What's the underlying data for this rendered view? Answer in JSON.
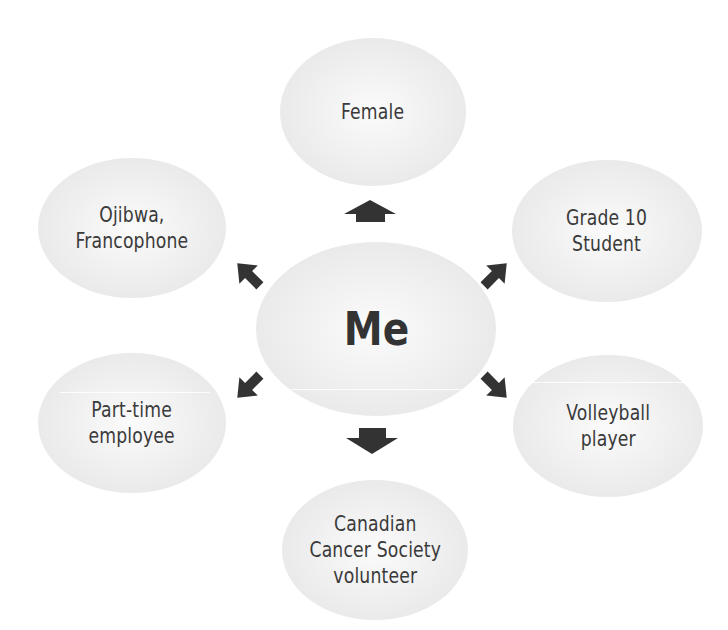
{
  "diagram": {
    "type": "identity-mind-map",
    "center": {
      "label": "Me"
    },
    "nodes": [
      {
        "id": "top",
        "label": "Female"
      },
      {
        "id": "upper-left",
        "label": "Ojibwa,\nFrancophone"
      },
      {
        "id": "upper-right",
        "label": "Grade 10\nStudent"
      },
      {
        "id": "lower-left",
        "label": "Part-time\nemployee"
      },
      {
        "id": "lower-right",
        "label": "Volleyball\nplayer"
      },
      {
        "id": "bottom",
        "label": "Canadian\nCancer Society\nvolunteer"
      }
    ],
    "arrows": [
      "up",
      "up-left",
      "up-right",
      "down-left",
      "down-right",
      "down"
    ],
    "colors": {
      "ellipse_fill": "#ececec",
      "arrow": "#333333",
      "text": "#3a3a3a",
      "background": "#ffffff"
    }
  }
}
